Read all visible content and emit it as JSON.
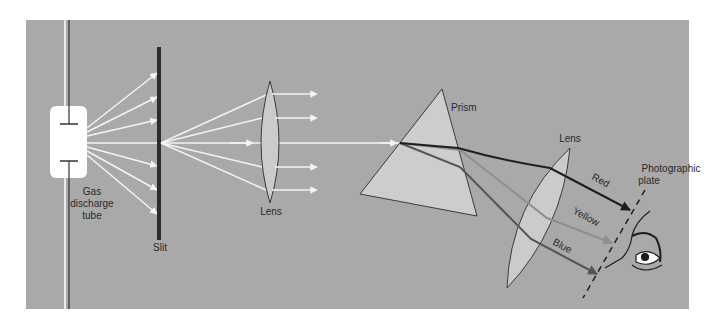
{
  "colors": {
    "background": "#a9a9a9",
    "ray": "#f4f4f4",
    "glass": "#cfcfcf",
    "slit": "#2b2b2b",
    "red_ray": "#1e1e1e",
    "yellow_ray": "#8e8e8e",
    "blue_ray": "#555555"
  },
  "labels": {
    "tube_line1": "Gas",
    "tube_line2": "discharge",
    "tube_line3": "tube",
    "slit": "Slit",
    "lens1": "Lens",
    "prism": "Prism",
    "lens2": "Lens",
    "plate_line1": "Photographic",
    "plate_line2": "plate",
    "red": "Red",
    "yellow": "Yellow",
    "blue": "Blue"
  }
}
